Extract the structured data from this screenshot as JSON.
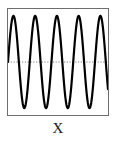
{
  "figure": {
    "axis_label": "X",
    "border_color": "#6e6e6e",
    "background_color": "#ffffff"
  },
  "chart_data": {
    "type": "line",
    "title": "",
    "xlabel": "X",
    "ylabel": "",
    "grid": false,
    "legend": null,
    "annotations": [
      {
        "name": "zero-reference-line",
        "style": "dotted",
        "color": "#808080",
        "y": 0,
        "orientation": "horizontal"
      }
    ],
    "xlim": [
      0,
      4.6
    ],
    "ylim": [
      -1.15,
      1.15
    ],
    "series": [
      {
        "name": "oscillation",
        "color": "#000000",
        "line_width": 2.2,
        "waveform": "sine",
        "cycles": 4.6,
        "amplitude": 1.0,
        "phase": 0.0,
        "x": [
          0.0,
          0.05,
          0.1,
          0.15,
          0.2,
          0.25,
          0.3,
          0.35,
          0.4,
          0.45,
          0.5,
          0.55,
          0.6,
          0.65,
          0.7,
          0.75,
          0.8,
          0.85,
          0.9,
          0.95,
          1.0,
          1.05,
          1.1,
          1.15,
          1.2,
          1.25,
          1.3,
          1.35,
          1.4,
          1.45,
          1.5,
          1.55,
          1.6,
          1.65,
          1.7,
          1.75,
          1.8,
          1.85,
          1.9,
          1.95,
          2.0,
          2.05,
          2.1,
          2.15,
          2.2,
          2.25,
          2.3,
          2.35,
          2.4,
          2.45,
          2.5,
          2.55,
          2.6,
          2.65,
          2.7,
          2.75,
          2.8,
          2.85,
          2.9,
          2.95,
          3.0,
          3.05,
          3.1,
          3.15,
          3.2,
          3.25,
          3.3,
          3.35,
          3.4,
          3.45,
          3.5,
          3.55,
          3.6,
          3.65,
          3.7,
          3.75,
          3.8,
          3.85,
          3.9,
          3.95,
          4.0,
          4.05,
          4.1,
          4.15,
          4.2,
          4.25,
          4.3,
          4.35,
          4.4,
          4.45,
          4.5,
          4.55,
          4.6
        ],
        "y": [
          0.0,
          0.309,
          0.588,
          0.809,
          0.951,
          1.0,
          0.951,
          0.809,
          0.588,
          0.309,
          0.0,
          -0.309,
          -0.588,
          -0.809,
          -0.951,
          -1.0,
          -0.951,
          -0.809,
          -0.588,
          -0.309,
          0.0,
          0.309,
          0.588,
          0.809,
          0.951,
          1.0,
          0.951,
          0.809,
          0.588,
          0.309,
          0.0,
          -0.309,
          -0.588,
          -0.809,
          -0.951,
          -1.0,
          -0.951,
          -0.809,
          -0.588,
          -0.309,
          0.0,
          0.309,
          0.588,
          0.809,
          0.951,
          1.0,
          0.951,
          0.809,
          0.588,
          0.309,
          0.0,
          -0.309,
          -0.588,
          -0.809,
          -0.951,
          -1.0,
          -0.951,
          -0.809,
          -0.588,
          -0.309,
          0.0,
          0.309,
          0.588,
          0.809,
          0.951,
          1.0,
          0.951,
          0.809,
          0.588,
          0.309,
          0.0,
          -0.309,
          -0.588,
          -0.809,
          -0.951,
          -1.0,
          -0.951,
          -0.809,
          -0.588,
          -0.309,
          0.0,
          0.309,
          0.588,
          0.809,
          0.951,
          1.0,
          0.951,
          0.809,
          0.588,
          0.309,
          0.0,
          -0.309,
          -0.588
        ]
      }
    ]
  }
}
